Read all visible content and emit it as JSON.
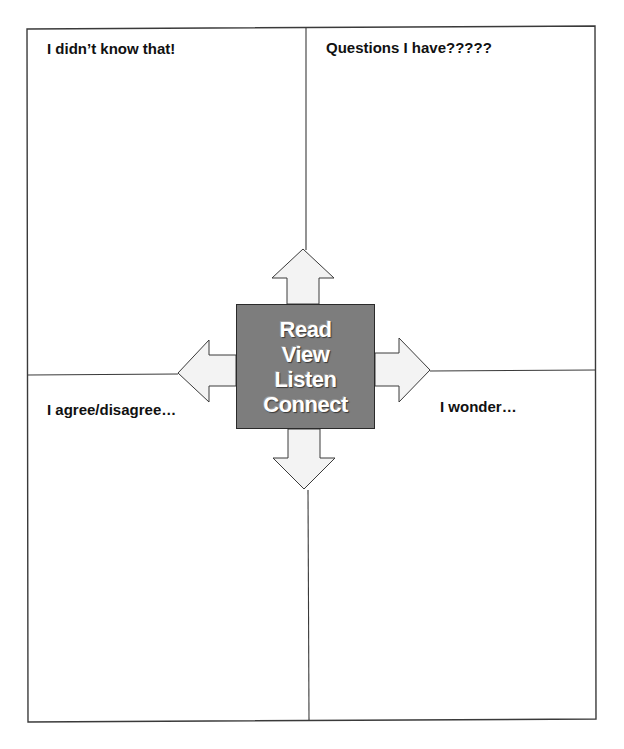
{
  "worksheet": {
    "quadrants": {
      "top_left": "I didn’t know that!",
      "top_right": "Questions I have?????",
      "bottom_left": "I agree/disagree…",
      "bottom_right": "I wonder…"
    },
    "center": {
      "words": [
        "Read",
        "View",
        "Listen",
        "Connect"
      ]
    },
    "arrows": [
      "up-arrow",
      "down-arrow",
      "left-arrow",
      "right-arrow"
    ],
    "colors": {
      "frame": "#3a3a3a",
      "center_fill": "#7d7d7d",
      "center_text": "#ffffff",
      "arrow_fill": "#f3f3f3"
    }
  }
}
